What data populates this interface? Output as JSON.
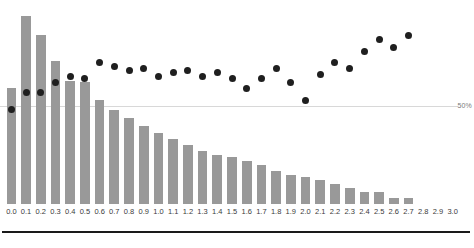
{
  "chart_data": {
    "type": "bar",
    "title": "",
    "subtitle": "",
    "xlabel": "",
    "ylabel": "",
    "grid": true,
    "legend_position": "none",
    "xlim": [
      -0.05,
      3.05
    ],
    "ylim": [
      0,
      100
    ],
    "reference_lines": [
      {
        "label": "50%",
        "value": 50
      }
    ],
    "categories": [
      "0.0",
      "0.1",
      "0.2",
      "0.3",
      "0.4",
      "0.5",
      "0.6",
      "0.7",
      "0.8",
      "0.9",
      "1.0",
      "1.1",
      "1.2",
      "1.3",
      "1.4",
      "1.5",
      "1.6",
      "1.7",
      "1.8",
      "1.9",
      "2.0",
      "2.1",
      "2.2",
      "2.3",
      "2.4",
      "2.5",
      "2.6",
      "2.7",
      "2.8",
      "2.9",
      "3.0"
    ],
    "series": [
      {
        "name": "Distribution",
        "type": "bar",
        "color": "#999999",
        "values": [
          59,
          96,
          86,
          73,
          63,
          62,
          53,
          48,
          44,
          40,
          36,
          33,
          30,
          27,
          25,
          24,
          22,
          20,
          17,
          15,
          14,
          12,
          10,
          8,
          6,
          6,
          3,
          3,
          0,
          0,
          0
        ]
      },
      {
        "name": "Rate",
        "type": "scatter",
        "color": "#1f1f1f",
        "values": [
          48,
          57,
          57,
          62,
          65,
          64,
          72,
          70,
          68,
          69,
          65,
          67,
          68,
          65,
          67,
          64,
          59,
          64,
          69,
          62,
          53,
          66,
          72,
          69,
          78,
          84,
          80,
          86,
          null,
          null,
          null
        ]
      }
    ]
  }
}
